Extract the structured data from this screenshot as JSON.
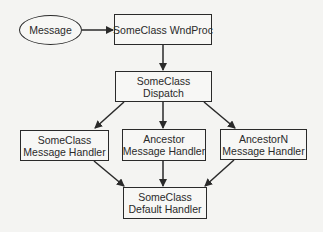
{
  "diagram": {
    "nodes": {
      "message": {
        "lines": [
          "Message"
        ],
        "shape": "ellipse"
      },
      "wndproc": {
        "lines": [
          "SomeClass WndProc"
        ],
        "shape": "rect"
      },
      "dispatch": {
        "lines": [
          "SomeClass",
          "Dispatch"
        ],
        "shape": "rect"
      },
      "someclass_handler": {
        "lines": [
          "SomeClass",
          "Message Handler"
        ],
        "shape": "rect"
      },
      "ancestor_handler": {
        "lines": [
          "Ancestor",
          "Message Handler"
        ],
        "shape": "rect"
      },
      "ancestorn_handler": {
        "lines": [
          "AncestorN",
          "Message Handler"
        ],
        "shape": "rect"
      },
      "default_handler": {
        "lines": [
          "SomeClass",
          "Default Handler"
        ],
        "shape": "rect"
      }
    },
    "edges": [
      {
        "from": "message",
        "to": "wndproc"
      },
      {
        "from": "wndproc",
        "to": "dispatch"
      },
      {
        "from": "dispatch",
        "to": "someclass_handler"
      },
      {
        "from": "dispatch",
        "to": "ancestor_handler"
      },
      {
        "from": "dispatch",
        "to": "ancestorn_handler"
      },
      {
        "from": "someclass_handler",
        "to": "default_handler"
      },
      {
        "from": "ancestor_handler",
        "to": "default_handler"
      },
      {
        "from": "ancestorn_handler",
        "to": "default_handler"
      }
    ],
    "colors": {
      "stroke": "#2a2a2a",
      "background": "#f4f4f2"
    }
  }
}
